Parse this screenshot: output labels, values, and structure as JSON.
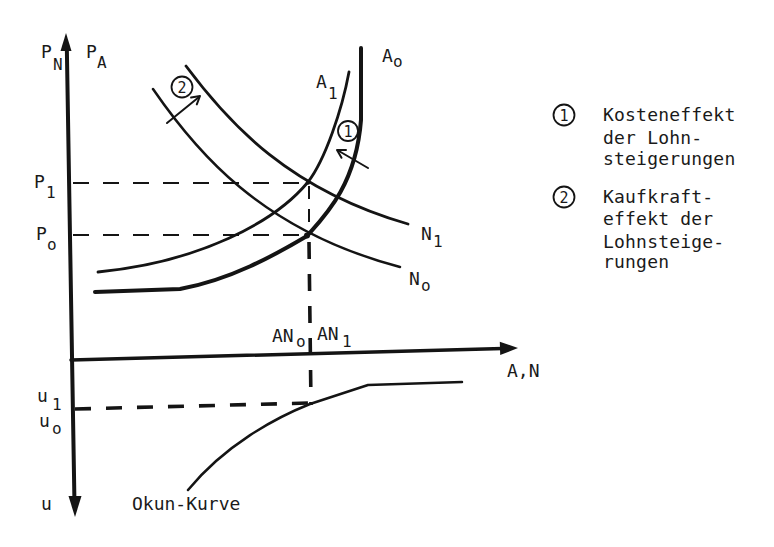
{
  "diagram": {
    "type": "economic-model-sketch",
    "ink_color": "#141414",
    "background": "#ffffff"
  },
  "axes": {
    "y_up_label_1": {
      "main": "P",
      "sub": "N"
    },
    "y_up_label_2": {
      "main": "P",
      "sub": "A"
    },
    "y_down_label": "u",
    "x_label": "A,N"
  },
  "price_levels": [
    {
      "main": "P",
      "sub": "1"
    },
    {
      "main": "P",
      "sub": "o"
    }
  ],
  "unemployment_levels": [
    {
      "main": "u",
      "sub": "1"
    },
    {
      "main": "u",
      "sub": "o"
    }
  ],
  "quantity_labels": [
    {
      "main": "AN",
      "sub": "o"
    },
    {
      "main": "AN",
      "sub": "1"
    }
  ],
  "curves": {
    "A0": {
      "main": "A",
      "sub": "o"
    },
    "A1": {
      "main": "A",
      "sub": "1"
    },
    "N1": {
      "main": "N",
      "sub": "1"
    },
    "N0": {
      "main": "N",
      "sub": "o"
    },
    "okun": "Okun-Kurve"
  },
  "effect_markers": [
    {
      "number": "1",
      "description": "shift of A-curve (A_o to A_1)"
    },
    {
      "number": "2",
      "description": "shift of N-curve (N_o to N_1)"
    }
  ],
  "legend": [
    {
      "marker": "1",
      "lines": [
        "Kosteneffekt",
        "der Lohn-",
        "steigerungen"
      ]
    },
    {
      "marker": "2",
      "lines": [
        "Kaufkraft-",
        "effekt der",
        "Lohnsteige-",
        "rungen"
      ]
    }
  ]
}
